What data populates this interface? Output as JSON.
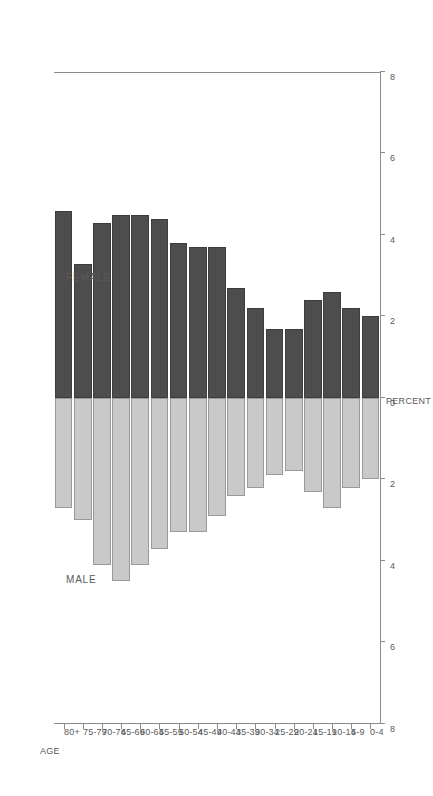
{
  "chart_data": {
    "type": "bar",
    "subtype": "population-pyramid",
    "title": "",
    "xlabel": "PERCENT",
    "ylabel": "AGE",
    "orientation": "horizontal-rotated",
    "categories": [
      "80+",
      "75-79",
      "70-74",
      "65-69",
      "60-64",
      "55-59",
      "50-54",
      "45-49",
      "40-44",
      "35-39",
      "30-34",
      "25-29",
      "20-24",
      "15-19",
      "10-14",
      "5-9",
      "0-4"
    ],
    "series": [
      {
        "name": "FEMALE",
        "color": "#4d4d4d",
        "values": [
          4.6,
          3.3,
          4.3,
          4.5,
          4.5,
          4.4,
          3.8,
          3.7,
          3.7,
          2.7,
          2.2,
          1.7,
          1.7,
          2.4,
          2.6,
          2.2,
          2.0
        ]
      },
      {
        "name": "MALE",
        "color": "#c9c9c9",
        "values": [
          2.7,
          3.0,
          4.1,
          4.5,
          4.1,
          3.7,
          3.3,
          3.3,
          2.9,
          2.4,
          2.2,
          1.9,
          1.8,
          2.3,
          2.7,
          2.2,
          2.0
        ]
      }
    ],
    "axis_ticks": [
      8,
      6,
      4,
      2,
      0,
      2,
      4,
      6,
      8
    ],
    "xlim": [
      -8,
      8
    ],
    "grid": false,
    "legend": "inline-annotations",
    "annotations": [
      {
        "text": "FEMALE",
        "side": "female"
      },
      {
        "text": "MALE",
        "side": "male"
      }
    ]
  },
  "labels": {
    "age_axis_title": "AGE",
    "percent_axis_title": "PERCENT",
    "female": "FEMALE",
    "male": "MALE"
  }
}
